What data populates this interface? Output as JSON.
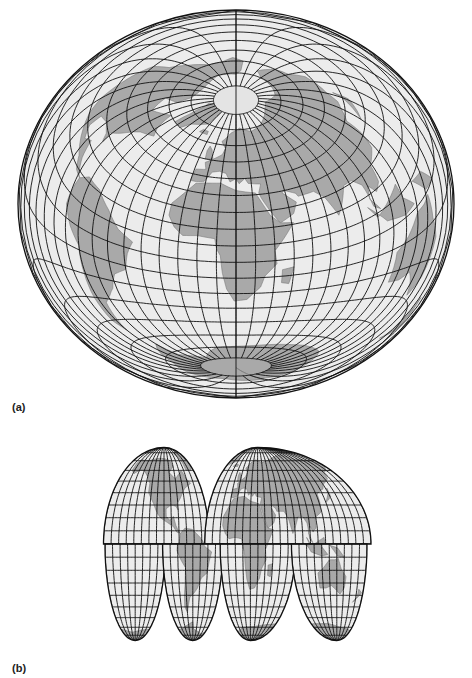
{
  "figure": {
    "panels": [
      {
        "id": "a",
        "label": "(a)",
        "projection": "oblique equal-area globe (world, single piece)",
        "graticule_interval_deg": 10
      },
      {
        "id": "b",
        "label": "(b)",
        "projection": "interrupted homolosine (four lobes)",
        "graticule_interval_deg": 10,
        "lobes": [
          "north-america-pacific",
          "south-america-atlantic",
          "africa-europe",
          "asia-australia"
        ]
      }
    ],
    "colors": {
      "ocean": "#ececec",
      "land": "#a9a9a9",
      "graticule": "#111111",
      "background": "#ffffff"
    }
  }
}
